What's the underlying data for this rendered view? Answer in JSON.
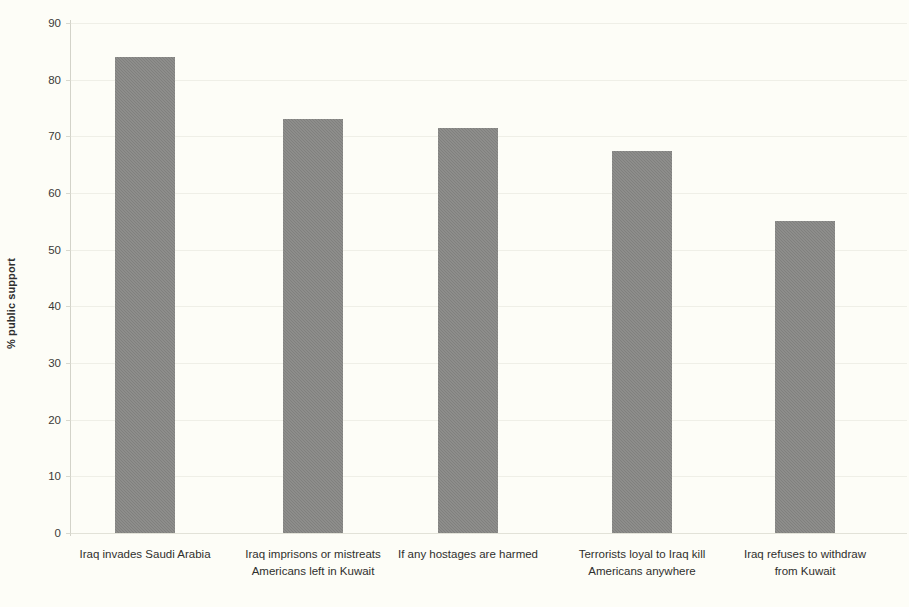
{
  "chart_data": {
    "type": "bar",
    "title": "",
    "xlabel": "",
    "ylabel": "% public support",
    "ylim": [
      0,
      90
    ],
    "ytick_step": 10,
    "yticks": [
      90,
      80,
      70,
      60,
      50,
      40,
      30,
      20,
      10,
      0
    ],
    "grid": true,
    "legend": "none",
    "bar_color": "#80807e",
    "background_color": "#fdfdf7",
    "categories": [
      "Iraq invades Saudi Arabia",
      "Iraq imprisons or mistreats\nAmericans left in Kuwait",
      "If any hostages are harmed",
      "Terrorists loyal to Iraq kill\nAmericans anywhere",
      "Iraq refuses to withdraw\nfrom Kuwait"
    ],
    "values": [
      84,
      73,
      71.5,
      67.5,
      55
    ],
    "series": [
      {
        "name": "% public support",
        "values": [
          84,
          73,
          71.5,
          67.5,
          55
        ]
      }
    ]
  }
}
